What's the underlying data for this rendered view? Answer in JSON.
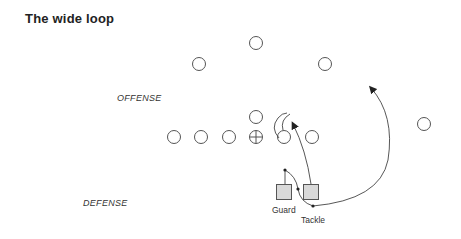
{
  "title": "The wide loop",
  "labels": {
    "offense": "OFFENSE",
    "defense": "DEFENSE",
    "guard": "Guard",
    "tackle": "Tackle"
  },
  "colors": {
    "stroke": "#555555",
    "square_fill": "#d9d9d9",
    "text": "#222222"
  },
  "offense_players": [
    {
      "role": "deep-back",
      "x": 256,
      "y": 43
    },
    {
      "role": "left-back",
      "x": 199,
      "y": 64
    },
    {
      "role": "right-back",
      "x": 325,
      "y": 64
    },
    {
      "role": "quarterback",
      "x": 256,
      "y": 117
    },
    {
      "role": "line-1",
      "x": 174,
      "y": 137
    },
    {
      "role": "line-2",
      "x": 201,
      "y": 137
    },
    {
      "role": "line-3",
      "x": 229,
      "y": 137
    },
    {
      "role": "center",
      "x": 256,
      "y": 137
    },
    {
      "role": "line-5",
      "x": 284,
      "y": 137
    },
    {
      "role": "line-6",
      "x": 312,
      "y": 137
    },
    {
      "role": "split-end",
      "x": 424,
      "y": 124
    }
  ],
  "defense_players": [
    {
      "role": "guard",
      "x": 284,
      "y": 192
    },
    {
      "role": "tackle",
      "x": 311,
      "y": 192
    }
  ]
}
